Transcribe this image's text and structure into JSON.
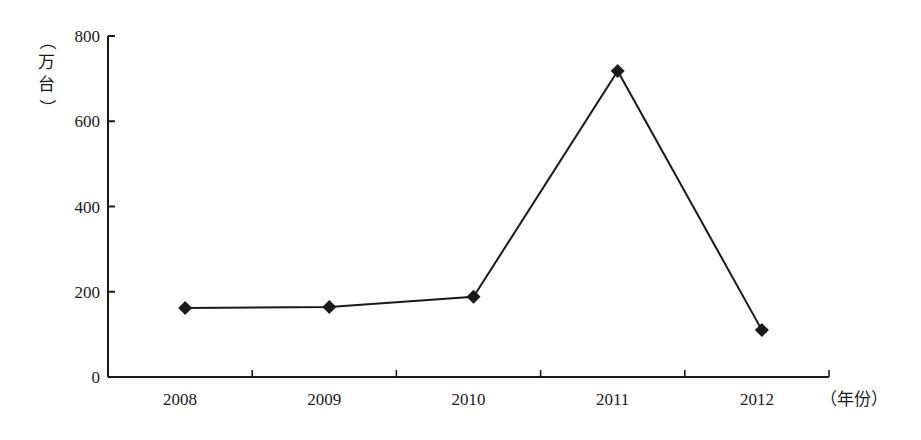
{
  "chart_data": {
    "type": "line",
    "title": "",
    "xlabel": "（年份）",
    "ylabel": "（万台）",
    "categories": [
      "2008",
      "2009",
      "2010",
      "2011",
      "2012"
    ],
    "series": [
      {
        "name": "",
        "values": [
          162,
          164,
          188,
          718,
          110
        ],
        "marker": "diamond",
        "color": "#1a1a1a"
      }
    ],
    "ylim": [
      0,
      800
    ],
    "yticks": [
      0,
      200,
      400,
      600,
      800
    ],
    "grid": false,
    "legend": "none"
  },
  "labels": {
    "ylabel_open": "（",
    "ylabel_chars": [
      "万",
      "台"
    ],
    "ylabel_close": "）",
    "xlabel": "（年份）"
  }
}
